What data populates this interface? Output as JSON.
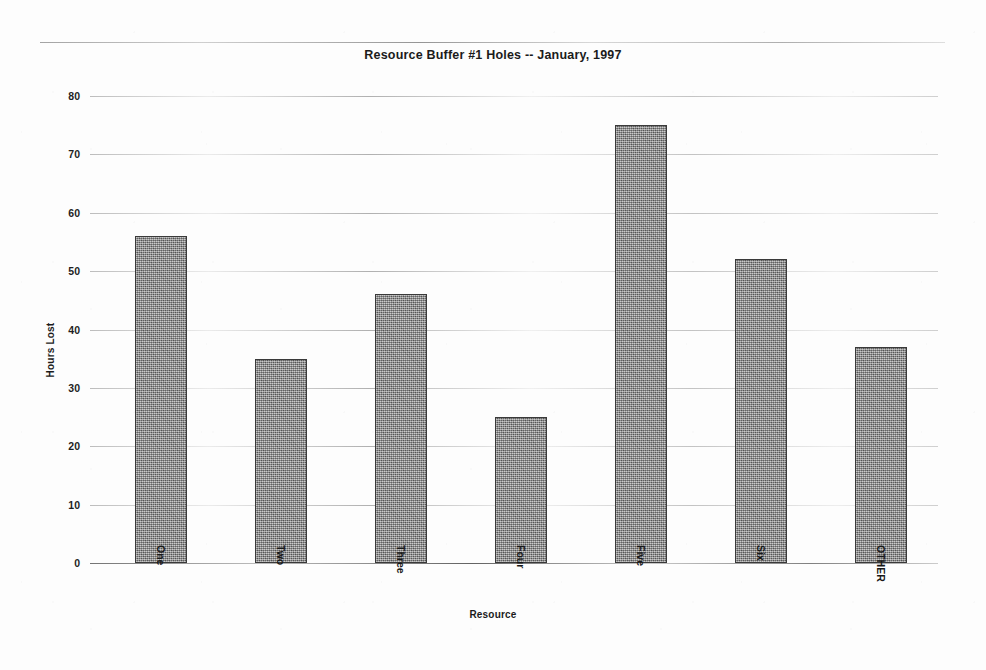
{
  "chart_data": {
    "type": "bar",
    "title": "Resource Buffer  #1 Holes -- January, 1997",
    "xlabel": "Resource",
    "ylabel": "Hours Lost",
    "categories": [
      "One",
      "Two",
      "Three",
      "Four",
      "Five",
      "Six",
      "OTHER"
    ],
    "values": [
      56,
      35,
      46,
      25,
      75,
      52,
      37
    ],
    "ylim": [
      0,
      80
    ],
    "ytick_labels": [
      "80",
      "70",
      "60",
      "50",
      "40",
      "30",
      "20",
      "10",
      "0"
    ],
    "ytick_values": [
      80,
      70,
      60,
      50,
      40,
      30,
      20,
      10,
      0
    ],
    "ytick_step": 10,
    "grid": true,
    "legend": "none",
    "bar_color": "#8d8d8d",
    "bar_edge_color": "#3a3a3a",
    "background_color": "#fdfdfd",
    "text_color": "#1b1b1b",
    "xtick_rotation": 90
  }
}
